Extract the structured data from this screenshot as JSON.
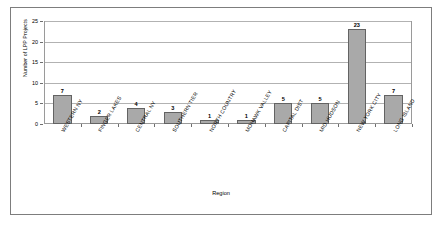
{
  "chart_data": {
    "type": "bar",
    "title": "",
    "xlabel": "Region",
    "ylabel": "Number of LPP Projects",
    "categories": [
      "WESTERN NY",
      "FINGER LAKES",
      "CENTRAL NY",
      "SOUTHERN TIER",
      "NORTH COUNTRY",
      "MOHAWK VALLEY",
      "CAPITAL DIST",
      "MID HUDSON",
      "NEW YORK CITY",
      "LONG ISLAND"
    ],
    "values": [
      7,
      2,
      4,
      3,
      1,
      1,
      5,
      5,
      23,
      7
    ],
    "ylim": [
      0,
      25
    ],
    "yticks": [
      0,
      5,
      10,
      15,
      20,
      25
    ],
    "ytick_labels": [
      "0",
      "5",
      "10",
      "15",
      "20",
      "25"
    ],
    "grid": true,
    "legend": false,
    "bar_color": "#a9a9a9",
    "bar_border_color": "#636363",
    "gridline_color": "#b2b2b2",
    "axis_color": "#9a9a9a",
    "frame_color": "#7d7d7d",
    "data_labels": [
      "7",
      "2",
      "4",
      "3",
      "1",
      "1",
      "5",
      "5",
      "23",
      "7"
    ]
  }
}
